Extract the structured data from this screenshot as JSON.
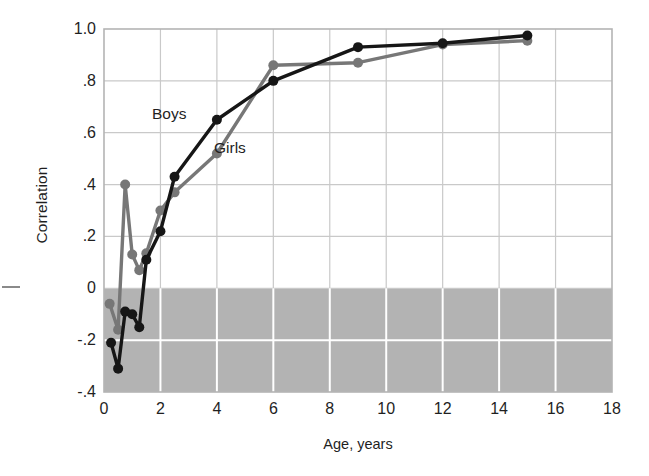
{
  "chart_data": {
    "type": "line",
    "title": "",
    "xlabel": "Age, years",
    "ylabel": "Correlation",
    "xlim": [
      0,
      18
    ],
    "ylim": [
      -0.4,
      1.0
    ],
    "xticks": [
      "0",
      "2",
      "4",
      "6",
      "8",
      "10",
      "12",
      "14",
      "16",
      "18"
    ],
    "xtick_values": [
      0,
      2,
      4,
      6,
      8,
      10,
      12,
      14,
      16,
      18
    ],
    "yticks": [
      "1.0",
      ".8",
      ".6",
      ".4",
      ".2",
      "0",
      "-.2",
      "-.4"
    ],
    "ytick_values": [
      1.0,
      0.8,
      0.6,
      0.4,
      0.2,
      0,
      -0.2,
      -0.4
    ],
    "grid": true,
    "legend_position": "inside-plot",
    "shaded_region": {
      "label": "negative-correlation-band",
      "from": -0.4,
      "to": 0.0,
      "color": "#b3b3b3"
    },
    "series": [
      {
        "name": "Boys",
        "color": "#161616",
        "points": [
          {
            "x": 0.25,
            "y": -0.21
          },
          {
            "x": 0.5,
            "y": -0.31
          },
          {
            "x": 0.75,
            "y": -0.09
          },
          {
            "x": 1.0,
            "y": -0.1
          },
          {
            "x": 1.25,
            "y": -0.15
          },
          {
            "x": 1.5,
            "y": 0.11
          },
          {
            "x": 2.0,
            "y": 0.22
          },
          {
            "x": 2.5,
            "y": 0.43
          },
          {
            "x": 4.0,
            "y": 0.65
          },
          {
            "x": 6.0,
            "y": 0.8
          },
          {
            "x": 9.0,
            "y": 0.93
          },
          {
            "x": 12.0,
            "y": 0.945
          },
          {
            "x": 15.0,
            "y": 0.975
          }
        ]
      },
      {
        "name": "Girls",
        "color": "#777777",
        "points": [
          {
            "x": 0.2,
            "y": -0.06
          },
          {
            "x": 0.5,
            "y": -0.16
          },
          {
            "x": 0.75,
            "y": 0.4
          },
          {
            "x": 1.0,
            "y": 0.13
          },
          {
            "x": 1.25,
            "y": 0.07
          },
          {
            "x": 1.5,
            "y": 0.135
          },
          {
            "x": 2.0,
            "y": 0.3
          },
          {
            "x": 2.5,
            "y": 0.37
          },
          {
            "x": 4.0,
            "y": 0.52
          },
          {
            "x": 6.0,
            "y": 0.86
          },
          {
            "x": 9.0,
            "y": 0.87
          },
          {
            "x": 12.0,
            "y": 0.94
          },
          {
            "x": 15.0,
            "y": 0.955
          }
        ]
      }
    ]
  },
  "axes": {
    "y_title": "Correlation",
    "x_title": "Age, years"
  },
  "legend": {
    "boys": "Boys",
    "girls": "Girls"
  },
  "colors": {
    "boys_series": "#161616",
    "girls_series": "#777777",
    "shaded_band": "#b3b3b3",
    "gridline": "#c9c9c9",
    "gridline_on_shade": "#ffffff",
    "axis_frame": "#b4b4b4",
    "text": "#1f1f1f"
  }
}
